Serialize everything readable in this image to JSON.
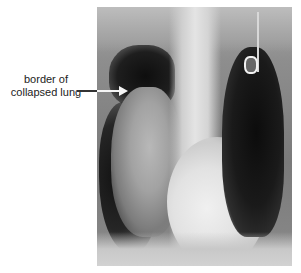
{
  "figure": {
    "type": "chest-xray",
    "annotation": {
      "label_line1": "border of",
      "label_line2": "collapsed lung"
    },
    "colors": {
      "background": "#ffffff",
      "label_text": "#222222",
      "arrow_outside": "#333333",
      "arrow_inside": "#f5f5f5"
    }
  }
}
